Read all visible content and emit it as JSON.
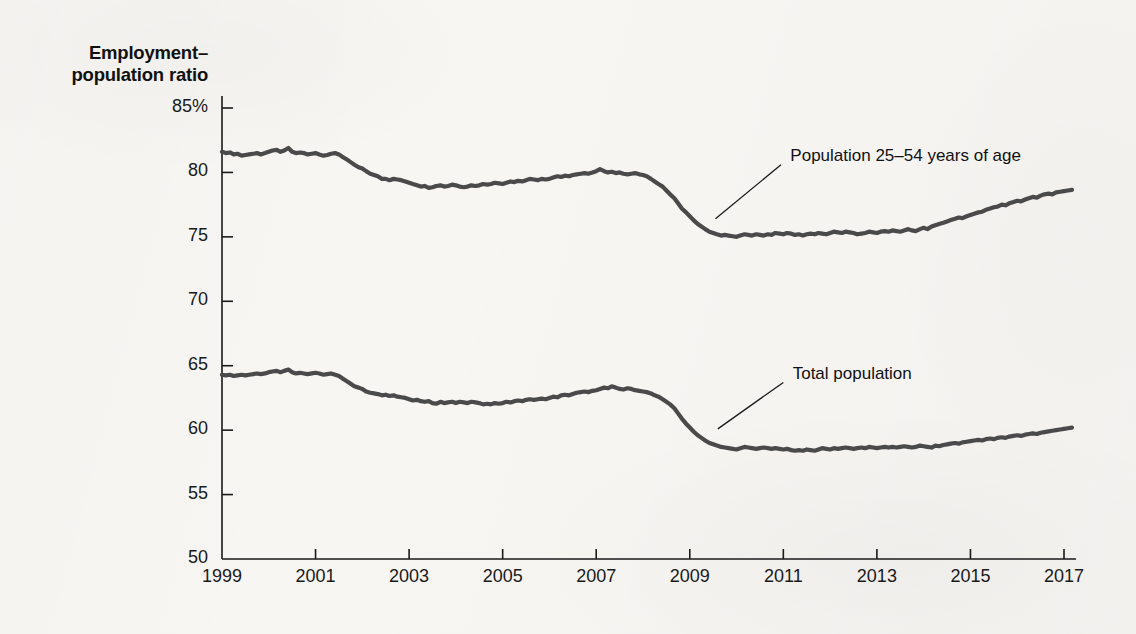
{
  "chart_data": {
    "type": "line",
    "title_line1": "Employment–",
    "title_line2": "population ratio",
    "xlabel": "",
    "ylabel": "Employment–population ratio",
    "xlim": [
      1999,
      2017.25
    ],
    "ylim": [
      50,
      85
    ],
    "grid": false,
    "legend_position": "inline-annotations",
    "yticks": [
      50,
      55,
      60,
      65,
      70,
      75,
      80,
      85
    ],
    "ytick_labels": [
      "50",
      "55",
      "60",
      "65",
      "70",
      "75",
      "80",
      "85%"
    ],
    "xticks": [
      1999,
      2001,
      2003,
      2005,
      2007,
      2009,
      2011,
      2013,
      2015,
      2017
    ],
    "xtick_labels": [
      "1999",
      "2001",
      "2003",
      "2005",
      "2007",
      "2009",
      "2011",
      "2013",
      "2015",
      "2017"
    ],
    "line_color": "#4a4a4a",
    "axis_color": "#1a1a1a",
    "background_color": "#f7f6f3",
    "annotations": [
      {
        "name": "prime-age-label",
        "text": "Population 25–54 years of age",
        "text_x": 2011.15,
        "text_y": 81.2,
        "leader_from_x": 2010.95,
        "leader_from_y": 80.6,
        "leader_to_x": 2009.55,
        "leader_to_y": 76.4
      },
      {
        "name": "total-population-label",
        "text": "Total population",
        "text_x": 2011.2,
        "text_y": 64.3,
        "leader_from_x": 2011.0,
        "leader_from_y": 63.7,
        "leader_to_x": 2009.6,
        "leader_to_y": 60.1
      }
    ],
    "series": [
      {
        "name": "Population 25–54 years of age",
        "color": "#4a4a4a",
        "x": [
          1999.0,
          1999.08,
          1999.17,
          1999.25,
          1999.33,
          1999.42,
          1999.5,
          1999.58,
          1999.67,
          1999.75,
          1999.83,
          1999.92,
          2000.0,
          2000.08,
          2000.17,
          2000.25,
          2000.33,
          2000.42,
          2000.5,
          2000.58,
          2000.67,
          2000.75,
          2000.83,
          2000.92,
          2001.0,
          2001.08,
          2001.17,
          2001.25,
          2001.33,
          2001.42,
          2001.5,
          2001.58,
          2001.67,
          2001.75,
          2001.83,
          2001.92,
          2002.0,
          2002.08,
          2002.17,
          2002.25,
          2002.33,
          2002.42,
          2002.5,
          2002.58,
          2002.67,
          2002.75,
          2002.83,
          2002.92,
          2003.0,
          2003.08,
          2003.17,
          2003.25,
          2003.33,
          2003.42,
          2003.5,
          2003.58,
          2003.67,
          2003.75,
          2003.83,
          2003.92,
          2004.0,
          2004.08,
          2004.17,
          2004.25,
          2004.33,
          2004.42,
          2004.5,
          2004.58,
          2004.67,
          2004.75,
          2004.83,
          2004.92,
          2005.0,
          2005.08,
          2005.17,
          2005.25,
          2005.33,
          2005.42,
          2005.5,
          2005.58,
          2005.67,
          2005.75,
          2005.83,
          2005.92,
          2006.0,
          2006.08,
          2006.17,
          2006.25,
          2006.33,
          2006.42,
          2006.5,
          2006.58,
          2006.67,
          2006.75,
          2006.83,
          2006.92,
          2007.0,
          2007.08,
          2007.17,
          2007.25,
          2007.33,
          2007.42,
          2007.5,
          2007.58,
          2007.67,
          2007.75,
          2007.83,
          2007.92,
          2008.0,
          2008.08,
          2008.17,
          2008.25,
          2008.33,
          2008.42,
          2008.5,
          2008.58,
          2008.67,
          2008.75,
          2008.83,
          2008.92,
          2009.0,
          2009.08,
          2009.17,
          2009.25,
          2009.33,
          2009.42,
          2009.5,
          2009.58,
          2009.67,
          2009.75,
          2009.83,
          2009.92,
          2010.0,
          2010.08,
          2010.17,
          2010.25,
          2010.33,
          2010.42,
          2010.5,
          2010.58,
          2010.67,
          2010.75,
          2010.83,
          2010.92,
          2011.0,
          2011.08,
          2011.17,
          2011.25,
          2011.33,
          2011.42,
          2011.5,
          2011.58,
          2011.67,
          2011.75,
          2011.83,
          2011.92,
          2012.0,
          2012.08,
          2012.17,
          2012.25,
          2012.33,
          2012.42,
          2012.5,
          2012.58,
          2012.67,
          2012.75,
          2012.83,
          2012.92,
          2013.0,
          2013.08,
          2013.17,
          2013.25,
          2013.33,
          2013.42,
          2013.5,
          2013.58,
          2013.67,
          2013.75,
          2013.83,
          2013.92,
          2014.0,
          2014.08,
          2014.17,
          2014.25,
          2014.33,
          2014.42,
          2014.5,
          2014.58,
          2014.67,
          2014.75,
          2014.83,
          2014.92,
          2015.0,
          2015.08,
          2015.17,
          2015.25,
          2015.33,
          2015.42,
          2015.5,
          2015.58,
          2015.67,
          2015.75,
          2015.83,
          2015.92,
          2016.0,
          2016.08,
          2016.17,
          2016.25,
          2016.33,
          2016.42,
          2016.5,
          2016.58,
          2016.67,
          2016.75,
          2016.83,
          2016.92,
          2017.0,
          2017.08,
          2017.17
        ],
        "values": [
          81.6,
          81.5,
          81.55,
          81.4,
          81.45,
          81.3,
          81.35,
          81.4,
          81.45,
          81.5,
          81.4,
          81.5,
          81.6,
          81.7,
          81.75,
          81.6,
          81.7,
          81.9,
          81.6,
          81.5,
          81.55,
          81.5,
          81.4,
          81.45,
          81.5,
          81.4,
          81.3,
          81.35,
          81.45,
          81.5,
          81.4,
          81.2,
          81.0,
          80.8,
          80.6,
          80.4,
          80.3,
          80.1,
          79.9,
          79.8,
          79.7,
          79.5,
          79.5,
          79.4,
          79.5,
          79.45,
          79.4,
          79.3,
          79.2,
          79.1,
          79.0,
          78.9,
          78.95,
          78.8,
          78.85,
          78.95,
          79.0,
          78.9,
          78.95,
          79.05,
          79.0,
          78.9,
          78.85,
          78.9,
          79.0,
          78.95,
          79.0,
          79.1,
          79.05,
          79.1,
          79.2,
          79.15,
          79.1,
          79.2,
          79.3,
          79.25,
          79.35,
          79.3,
          79.4,
          79.5,
          79.45,
          79.4,
          79.5,
          79.45,
          79.5,
          79.6,
          79.7,
          79.65,
          79.75,
          79.7,
          79.8,
          79.85,
          79.9,
          79.95,
          79.9,
          80.0,
          80.1,
          80.25,
          80.1,
          80.0,
          80.05,
          79.95,
          80.0,
          79.9,
          79.85,
          79.9,
          79.95,
          79.85,
          79.8,
          79.7,
          79.5,
          79.3,
          79.1,
          78.9,
          78.6,
          78.3,
          78.0,
          77.6,
          77.2,
          76.9,
          76.6,
          76.3,
          76.0,
          75.8,
          75.6,
          75.4,
          75.3,
          75.2,
          75.1,
          75.15,
          75.1,
          75.05,
          75.0,
          75.1,
          75.2,
          75.15,
          75.1,
          75.2,
          75.15,
          75.1,
          75.2,
          75.15,
          75.3,
          75.25,
          75.2,
          75.3,
          75.25,
          75.15,
          75.2,
          75.1,
          75.2,
          75.25,
          75.2,
          75.3,
          75.25,
          75.2,
          75.3,
          75.4,
          75.35,
          75.3,
          75.4,
          75.35,
          75.3,
          75.2,
          75.25,
          75.3,
          75.4,
          75.35,
          75.3,
          75.4,
          75.45,
          75.4,
          75.5,
          75.45,
          75.4,
          75.5,
          75.6,
          75.5,
          75.45,
          75.6,
          75.7,
          75.6,
          75.8,
          75.9,
          76.0,
          76.1,
          76.2,
          76.3,
          76.4,
          76.5,
          76.45,
          76.6,
          76.7,
          76.8,
          76.9,
          76.95,
          77.1,
          77.2,
          77.3,
          77.35,
          77.5,
          77.45,
          77.6,
          77.7,
          77.8,
          77.75,
          77.9,
          78.0,
          78.1,
          78.05,
          78.2,
          78.3,
          78.35,
          78.3,
          78.45,
          78.5,
          78.55,
          78.6,
          78.65
        ]
      },
      {
        "name": "Total population",
        "color": "#4a4a4a",
        "x": [
          1999.0,
          1999.08,
          1999.17,
          1999.25,
          1999.33,
          1999.42,
          1999.5,
          1999.58,
          1999.67,
          1999.75,
          1999.83,
          1999.92,
          2000.0,
          2000.08,
          2000.17,
          2000.25,
          2000.33,
          2000.42,
          2000.5,
          2000.58,
          2000.67,
          2000.75,
          2000.83,
          2000.92,
          2001.0,
          2001.08,
          2001.17,
          2001.25,
          2001.33,
          2001.42,
          2001.5,
          2001.58,
          2001.67,
          2001.75,
          2001.83,
          2001.92,
          2002.0,
          2002.08,
          2002.17,
          2002.25,
          2002.33,
          2002.42,
          2002.5,
          2002.58,
          2002.67,
          2002.75,
          2002.83,
          2002.92,
          2003.0,
          2003.08,
          2003.17,
          2003.25,
          2003.33,
          2003.42,
          2003.5,
          2003.58,
          2003.67,
          2003.75,
          2003.83,
          2003.92,
          2004.0,
          2004.08,
          2004.17,
          2004.25,
          2004.33,
          2004.42,
          2004.5,
          2004.58,
          2004.67,
          2004.75,
          2004.83,
          2004.92,
          2005.0,
          2005.08,
          2005.17,
          2005.25,
          2005.33,
          2005.42,
          2005.5,
          2005.58,
          2005.67,
          2005.75,
          2005.83,
          2005.92,
          2006.0,
          2006.08,
          2006.17,
          2006.25,
          2006.33,
          2006.42,
          2006.5,
          2006.58,
          2006.67,
          2006.75,
          2006.83,
          2006.92,
          2007.0,
          2007.08,
          2007.17,
          2007.25,
          2007.33,
          2007.42,
          2007.5,
          2007.58,
          2007.67,
          2007.75,
          2007.83,
          2007.92,
          2008.0,
          2008.08,
          2008.17,
          2008.25,
          2008.33,
          2008.42,
          2008.5,
          2008.58,
          2008.67,
          2008.75,
          2008.83,
          2008.92,
          2009.0,
          2009.08,
          2009.17,
          2009.25,
          2009.33,
          2009.42,
          2009.5,
          2009.58,
          2009.67,
          2009.75,
          2009.83,
          2009.92,
          2010.0,
          2010.08,
          2010.17,
          2010.25,
          2010.33,
          2010.42,
          2010.5,
          2010.58,
          2010.67,
          2010.75,
          2010.83,
          2010.92,
          2011.0,
          2011.08,
          2011.17,
          2011.25,
          2011.33,
          2011.42,
          2011.5,
          2011.58,
          2011.67,
          2011.75,
          2011.83,
          2011.92,
          2012.0,
          2012.08,
          2012.17,
          2012.25,
          2012.33,
          2012.42,
          2012.5,
          2012.58,
          2012.67,
          2012.75,
          2012.83,
          2012.92,
          2013.0,
          2013.08,
          2013.17,
          2013.25,
          2013.33,
          2013.42,
          2013.5,
          2013.58,
          2013.67,
          2013.75,
          2013.83,
          2013.92,
          2014.0,
          2014.08,
          2014.17,
          2014.25,
          2014.33,
          2014.42,
          2014.5,
          2014.58,
          2014.67,
          2014.75,
          2014.83,
          2014.92,
          2015.0,
          2015.08,
          2015.17,
          2015.25,
          2015.33,
          2015.42,
          2015.5,
          2015.58,
          2015.67,
          2015.75,
          2015.83,
          2015.92,
          2016.0,
          2016.08,
          2016.17,
          2016.25,
          2016.33,
          2016.42,
          2016.5,
          2016.58,
          2016.67,
          2016.75,
          2016.83,
          2016.92,
          2017.0,
          2017.08,
          2017.17
        ],
        "values": [
          64.3,
          64.25,
          64.3,
          64.2,
          64.25,
          64.3,
          64.25,
          64.3,
          64.35,
          64.4,
          64.35,
          64.4,
          64.5,
          64.55,
          64.6,
          64.5,
          64.6,
          64.7,
          64.5,
          64.4,
          64.45,
          64.4,
          64.35,
          64.4,
          64.45,
          64.4,
          64.3,
          64.35,
          64.4,
          64.3,
          64.2,
          64.0,
          63.8,
          63.6,
          63.4,
          63.3,
          63.2,
          63.0,
          62.9,
          62.85,
          62.8,
          62.7,
          62.75,
          62.65,
          62.7,
          62.6,
          62.55,
          62.5,
          62.4,
          62.3,
          62.35,
          62.25,
          62.2,
          62.25,
          62.1,
          62.05,
          62.2,
          62.1,
          62.15,
          62.2,
          62.1,
          62.2,
          62.15,
          62.1,
          62.2,
          62.15,
          62.1,
          62.0,
          62.05,
          62.0,
          62.1,
          62.05,
          62.1,
          62.2,
          62.15,
          62.25,
          62.3,
          62.25,
          62.35,
          62.4,
          62.35,
          62.4,
          62.45,
          62.4,
          62.5,
          62.6,
          62.55,
          62.7,
          62.75,
          62.7,
          62.8,
          62.9,
          62.95,
          63.0,
          62.95,
          63.05,
          63.1,
          63.2,
          63.3,
          63.25,
          63.4,
          63.3,
          63.2,
          63.15,
          63.25,
          63.2,
          63.1,
          63.05,
          63.0,
          62.95,
          62.85,
          62.7,
          62.6,
          62.4,
          62.2,
          62.0,
          61.7,
          61.3,
          60.9,
          60.5,
          60.2,
          59.9,
          59.6,
          59.4,
          59.2,
          59.0,
          58.9,
          58.8,
          58.7,
          58.65,
          58.6,
          58.55,
          58.5,
          58.6,
          58.7,
          58.65,
          58.6,
          58.55,
          58.6,
          58.65,
          58.6,
          58.55,
          58.6,
          58.55,
          58.5,
          58.55,
          58.45,
          58.4,
          58.45,
          58.4,
          58.5,
          58.45,
          58.4,
          58.5,
          58.6,
          58.55,
          58.5,
          58.6,
          58.55,
          58.6,
          58.65,
          58.6,
          58.55,
          58.6,
          58.65,
          58.6,
          58.7,
          58.65,
          58.6,
          58.65,
          58.7,
          58.65,
          58.7,
          58.65,
          58.7,
          58.75,
          58.7,
          58.65,
          58.7,
          58.8,
          58.75,
          58.7,
          58.65,
          58.8,
          58.75,
          58.85,
          58.9,
          58.95,
          59.0,
          58.95,
          59.05,
          59.1,
          59.15,
          59.2,
          59.25,
          59.2,
          59.3,
          59.35,
          59.3,
          59.4,
          59.45,
          59.4,
          59.5,
          59.55,
          59.6,
          59.55,
          59.65,
          59.7,
          59.75,
          59.7,
          59.8,
          59.85,
          59.9,
          59.95,
          60.0,
          60.05,
          60.1,
          60.15,
          60.2
        ]
      }
    ]
  }
}
